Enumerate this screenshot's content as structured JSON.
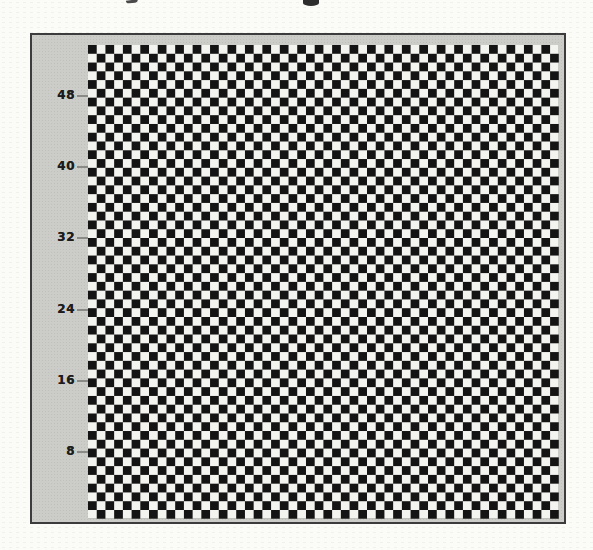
{
  "figure": {
    "title": "",
    "caption": ""
  },
  "chart_data": {
    "type": "heatmap",
    "pattern": "checkerboard",
    "rows": 54,
    "cols": 54,
    "cell_colors": [
      "#f3f3ef",
      "#141414"
    ],
    "top_left_cell": "dark",
    "title": "",
    "xlabel": "",
    "ylabel": "",
    "yticks": [
      48,
      40,
      32,
      24,
      16,
      8
    ],
    "xticks": [],
    "ylim": [
      0,
      54
    ],
    "axis_side": "left",
    "grid": false,
    "legend": false,
    "frame_fill_color": "#ccccc8",
    "frame_border_color": "#3c3c3c",
    "tick_label_color": "#1c1c1c",
    "tick_mark_color": "#8a8a86"
  }
}
